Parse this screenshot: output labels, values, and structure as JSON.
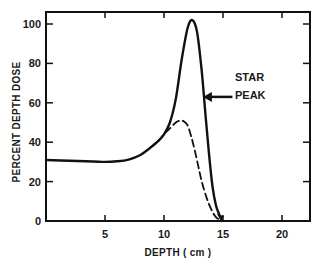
{
  "chart_data": {
    "type": "line",
    "title": "",
    "xlabel": "DEPTH ( cm )",
    "ylabel": "PERCENT DEPTH DOSE",
    "xlim": [
      0,
      22.3
    ],
    "ylim": [
      0,
      106
    ],
    "xticks": [
      5,
      10,
      15,
      20
    ],
    "yticks": [
      0,
      20,
      40,
      60,
      80,
      100
    ],
    "grid": false,
    "legend": null,
    "series": [
      {
        "name": "STAR PEAK",
        "style": "solid",
        "x": [
          0,
          2,
          4,
          5,
          6,
          7,
          8,
          8.8,
          9.5,
          10,
          10.5,
          11,
          11.5,
          12,
          12.4,
          12.8,
          13.2,
          13.5,
          13.8,
          14.1,
          14.4,
          14.7,
          14.9
        ],
        "y": [
          31,
          30.6,
          30.2,
          30,
          30.3,
          31.2,
          33.5,
          37,
          40.5,
          44,
          50,
          62,
          82,
          98,
          102,
          96,
          76,
          55,
          35,
          18,
          8,
          3,
          0
        ]
      },
      {
        "name": "Without peak",
        "style": "dashed",
        "x": [
          8.8,
          9.5,
          10,
          10.5,
          11,
          11.4,
          11.7,
          12,
          12.3,
          12.6,
          12.9,
          13.2,
          13.6,
          14,
          14.4,
          14.9
        ],
        "y": [
          37,
          40.5,
          44,
          47,
          50,
          51,
          50.5,
          48.5,
          43,
          36,
          28,
          20,
          12,
          6,
          2,
          0
        ]
      }
    ],
    "annotations": [
      {
        "text": "STAR",
        "x": 16.1,
        "y": 72
      },
      {
        "text": "PEAK",
        "x": 16.1,
        "y": 62
      },
      {
        "type": "arrow",
        "from_x": 15.8,
        "to_x": 13.3,
        "y": 63
      }
    ]
  },
  "labels": {
    "xlabel": "DEPTH ( cm )",
    "ylabel": "PERCENT DEPTH DOSE",
    "annot_line1": "STAR",
    "annot_line2": "PEAK"
  }
}
